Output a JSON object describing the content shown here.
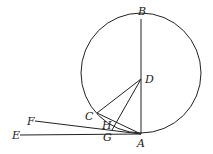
{
  "diagram": {
    "type": "geometry",
    "circle": {
      "cx": 141,
      "cy": 73,
      "r": 60
    },
    "points": {
      "A": {
        "label": "A",
        "x": 141,
        "y": 133
      },
      "B": {
        "label": "B",
        "x": 141,
        "y": 19
      },
      "C": {
        "label": "C",
        "x": 97,
        "y": 113
      },
      "D": {
        "label": "D",
        "x": 141,
        "y": 79
      },
      "E": {
        "label": "E",
        "x": 20,
        "y": 135
      },
      "F": {
        "label": "F",
        "x": 35,
        "y": 121
      },
      "G": {
        "label": "G",
        "x": 108,
        "y": 135
      },
      "H": {
        "label": "H",
        "x": 114,
        "y": 126
      }
    },
    "labels": {
      "A": "A",
      "B": "B",
      "C": "C",
      "D": "D",
      "E": "E",
      "F": "F",
      "G": "G",
      "H": "H"
    }
  }
}
